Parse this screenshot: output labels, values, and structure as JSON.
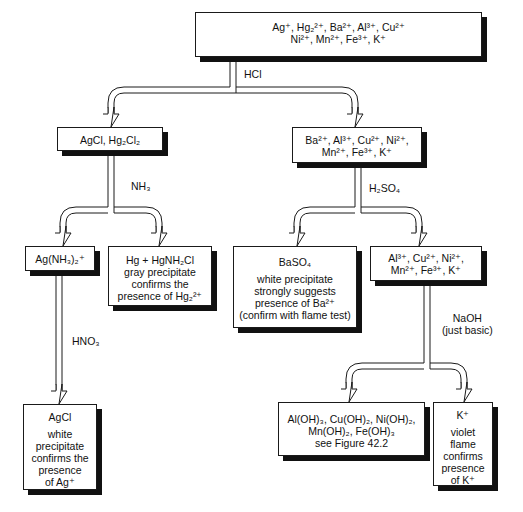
{
  "diagram": {
    "type": "flowchart",
    "nodes": {
      "start": {
        "lines": [
          "Ag⁺, Hg₂²⁺, Ba²⁺, Al³⁺, Cu²⁺",
          "Ni²⁺, Mn²⁺, Fe³⁺, K⁺"
        ]
      },
      "chloride_precipitate": {
        "lines": [
          "AgCl, Hg₂Cl₂"
        ]
      },
      "remaining_after_hcl": {
        "lines": [
          "Ba²⁺, Al³⁺, Cu²⁺, Ni²⁺,",
          "Mn²⁺, Fe³⁺, K⁺"
        ]
      },
      "silver_ammine": {
        "lines": [
          "Ag(NH₃)₂⁺"
        ]
      },
      "mercury_result": {
        "lines": [
          "Hg + HgNH₂Cl",
          "gray precipitate",
          "confirms the",
          "presence of Hg₂²⁺"
        ]
      },
      "barium_sulfate": {
        "title": "BaSO₄",
        "lines": [
          "white precipitate",
          "strongly suggests",
          "presence of Ba²⁺",
          "(confirm with flame test)"
        ]
      },
      "remaining_after_h2so4": {
        "lines": [
          "Al³⁺, Cu²⁺, Ni²⁺,",
          "Mn²⁺, Fe³⁺, K⁺"
        ]
      },
      "silver_chloride_final": {
        "title": "AgCl",
        "lines": [
          "white",
          "precipitate",
          "confirms the",
          "presence",
          "of Ag⁺"
        ]
      },
      "hydroxides": {
        "lines": [
          "Al(OH)₃, Cu(OH)₂, Ni(OH)₂,",
          "Mn(OH)₂, Fe(OH)₃",
          "see Figure 42.2"
        ]
      },
      "potassium": {
        "title": "K⁺",
        "lines": [
          "violet",
          "flame",
          "confirms",
          "presence",
          "of K⁺"
        ]
      }
    },
    "reagents": {
      "hcl": "HCl",
      "nh3": "NH₃",
      "h2so4": "H₂SO₄",
      "hno3": "HNO₃",
      "naoh": [
        "NaOH",
        "(just basic)"
      ]
    },
    "edges": [
      {
        "from": "start",
        "to": "chloride_precipitate",
        "reagent": "HCl"
      },
      {
        "from": "start",
        "to": "remaining_after_hcl",
        "reagent": "HCl"
      },
      {
        "from": "chloride_precipitate",
        "to": "silver_ammine",
        "reagent": "NH₃"
      },
      {
        "from": "chloride_precipitate",
        "to": "mercury_result",
        "reagent": "NH₃"
      },
      {
        "from": "remaining_after_hcl",
        "to": "barium_sulfate",
        "reagent": "H₂SO₄"
      },
      {
        "from": "remaining_after_hcl",
        "to": "remaining_after_h2so4",
        "reagent": "H₂SO₄"
      },
      {
        "from": "silver_ammine",
        "to": "silver_chloride_final",
        "reagent": "HNO₃"
      },
      {
        "from": "remaining_after_h2so4",
        "to": "hydroxides",
        "reagent": "NaOH (just basic)"
      },
      {
        "from": "remaining_after_h2so4",
        "to": "potassium",
        "reagent": "NaOH (just basic)"
      }
    ]
  },
  "colors": {
    "line": "#1a1a1a",
    "shadow": "#111111",
    "background": "#ffffff"
  }
}
